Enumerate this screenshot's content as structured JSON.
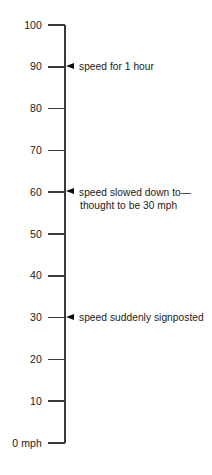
{
  "chart_data": {
    "type": "table",
    "title": "",
    "subtitle": "",
    "xlabel": "",
    "ylabel": "mph",
    "ylim": [
      0,
      100
    ],
    "grid": false,
    "legend": "none",
    "orientation": "vertical-scale",
    "axis_unit": "mph",
    "tick_step": 10,
    "tick_labels": [
      {
        "value": 100,
        "label": "100"
      },
      {
        "value": 90,
        "label": "90"
      },
      {
        "value": 80,
        "label": "80"
      },
      {
        "value": 70,
        "label": "70"
      },
      {
        "value": 60,
        "label": "60"
      },
      {
        "value": 50,
        "label": "50"
      },
      {
        "value": 40,
        "label": "40"
      },
      {
        "value": 30,
        "label": "30"
      },
      {
        "value": 20,
        "label": "20"
      },
      {
        "value": 10,
        "label": "10"
      },
      {
        "value": 0,
        "label": "0 mph"
      }
    ],
    "annotations": [
      {
        "value": 90,
        "marker": "left-triangle",
        "line1": "speed for 1 hour",
        "line2": ""
      },
      {
        "value": 60,
        "marker": "left-triangle",
        "line1": "speed slowed down to—",
        "line2": "thought to be 30 mph"
      },
      {
        "value": 30,
        "marker": "left-triangle",
        "line1": "speed suddenly signposted",
        "line2": ""
      }
    ],
    "colors": {
      "background": "#ffffff",
      "axis": "#3a3a3a",
      "text": "#1a1a1a",
      "marker": "#0d0d0d"
    }
  }
}
